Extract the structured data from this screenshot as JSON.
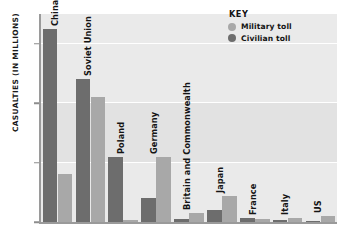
{
  "chart_data": {
    "type": "bar",
    "title": "",
    "xlabel": "",
    "ylabel": "CASUALTIES (IN MILLIONS)",
    "ylim": [
      0,
      17.5
    ],
    "yticks": [
      0,
      5,
      10,
      15
    ],
    "ytick_labels": [
      "0",
      "5",
      "10",
      "15"
    ],
    "grid": true,
    "legend_position": "top-right",
    "categories": [
      "China",
      "Soviet Union",
      "Poland",
      "Germany",
      "Britain and Commonwealth",
      "Japan",
      "France",
      "Italy",
      "US"
    ],
    "series": [
      {
        "name": "Civilian toll",
        "color": "#6d6d6d",
        "values": [
          16.2,
          12.0,
          5.5,
          2.0,
          0.25,
          1.0,
          0.35,
          0.2,
          0.02
        ]
      },
      {
        "name": "Military toll",
        "color": "#a8a8a8",
        "values": [
          4.0,
          10.5,
          0.2,
          5.5,
          0.8,
          2.2,
          0.25,
          0.35,
          0.5
        ]
      }
    ]
  },
  "legend": {
    "title": "KEY",
    "entries": [
      {
        "label": "Military toll",
        "color": "#a8a8a8"
      },
      {
        "label": "Civilian toll",
        "color": "#6d6d6d"
      }
    ]
  },
  "axis": {
    "y_title": "CASUALTIES (IN MILLIONS)"
  }
}
